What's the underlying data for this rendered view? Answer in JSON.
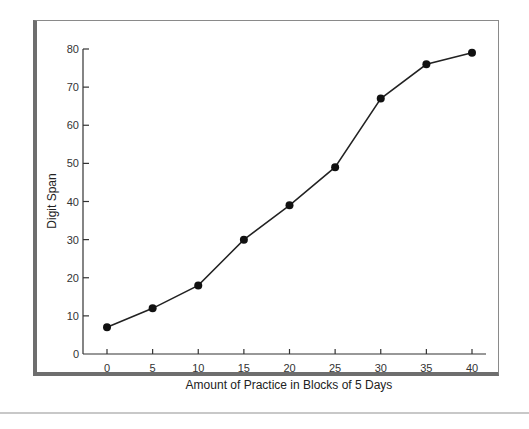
{
  "chart_data": {
    "type": "line",
    "title": "",
    "xlabel": "Amount of Practice in Blocks of 5 Days",
    "ylabel": "Digit Span",
    "x": [
      0,
      5,
      10,
      15,
      20,
      25,
      30,
      35,
      40
    ],
    "series": [
      {
        "name": "Digit Span",
        "values": [
          7,
          12,
          18,
          30,
          39,
          49,
          67,
          76,
          79
        ]
      }
    ],
    "xticks": [
      "0",
      "5",
      "10",
      "15",
      "20",
      "25",
      "30",
      "35",
      "40"
    ],
    "yticks": [
      "0",
      "10",
      "20",
      "30",
      "40",
      "50",
      "60",
      "70",
      "80"
    ],
    "xlim": [
      -4,
      43
    ],
    "ylim": [
      0,
      80
    ],
    "grid": false,
    "legend": "none",
    "marker": "filled-circle",
    "colors": {
      "line": "#222222",
      "marker": "#111111",
      "axis": "#333333"
    }
  }
}
